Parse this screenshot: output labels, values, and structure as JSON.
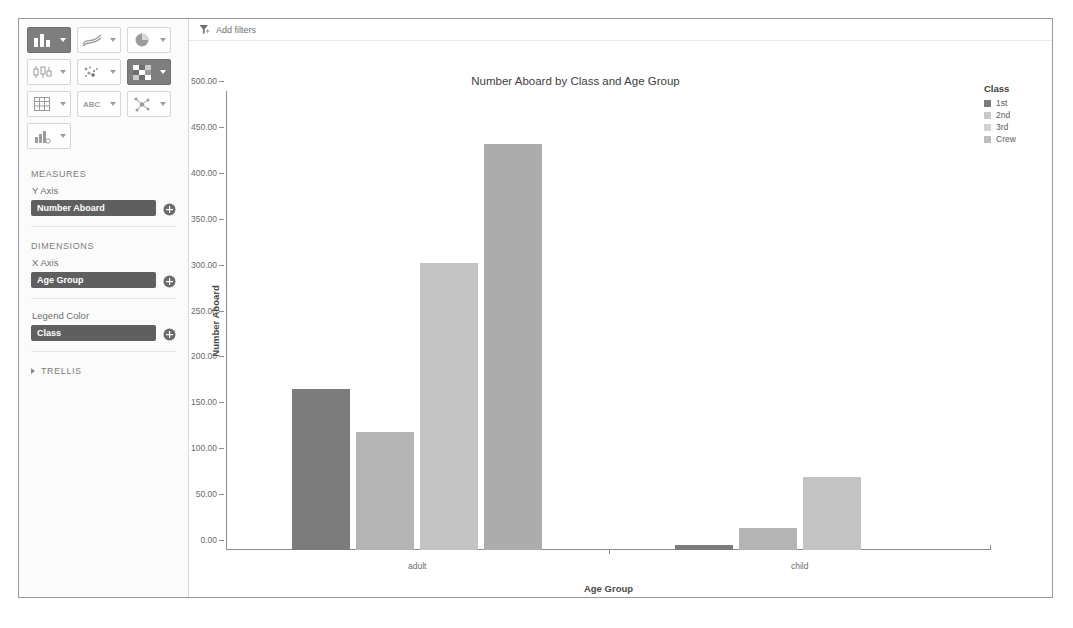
{
  "toolbar": {
    "filter_icon": "filter-icon",
    "add_filters_label": "Add filters"
  },
  "sidebar": {
    "chart_types": [
      {
        "id": "bar",
        "icon": "bar-chart-icon",
        "selected": true
      },
      {
        "id": "line",
        "icon": "line-chart-icon",
        "selected": false
      },
      {
        "id": "pie",
        "icon": "pie-chart-icon",
        "selected": false
      },
      {
        "id": "boxplot",
        "icon": "box-plot-icon",
        "selected": false
      },
      {
        "id": "scatter",
        "icon": "scatter-plot-icon",
        "selected": false
      },
      {
        "id": "heatmap",
        "icon": "heat-map-icon",
        "selected": true
      },
      {
        "id": "table",
        "icon": "table-grid-icon",
        "selected": false
      },
      {
        "id": "text",
        "icon": "abc-text-icon",
        "selected": false
      },
      {
        "id": "network",
        "icon": "network-graph-icon",
        "selected": false
      },
      {
        "id": "combo",
        "icon": "combo-chart-icon",
        "selected": false
      }
    ],
    "measures": {
      "section_label": "MEASURES",
      "fields": [
        {
          "label": "Y Axis",
          "value": "Number Aboard",
          "add_icon": "add-circle-icon"
        }
      ]
    },
    "dimensions": {
      "section_label": "DIMENSIONS",
      "fields": [
        {
          "label": "X Axis",
          "value": "Age Group",
          "add_icon": "add-circle-icon"
        },
        {
          "label": "Legend Color",
          "value": "Class",
          "add_icon": "add-circle-icon"
        }
      ]
    },
    "trellis": {
      "section_label": "TRELLIS",
      "expand_icon": "chevron-right-icon",
      "expanded": false
    }
  },
  "chart_data": {
    "type": "bar",
    "title": "Number Aboard by Class and Age Group",
    "xlabel": "Age Group",
    "ylabel": "Number Aboard",
    "categories": [
      "adult",
      "child"
    ],
    "series": [
      {
        "name": "1st",
        "color": "#7c7c7c",
        "values": [
          175,
          6
        ]
      },
      {
        "name": "2nd",
        "color": "#b4b4b4",
        "values": [
          129,
          24
        ]
      },
      {
        "name": "3rd",
        "color": "#c3c3c3",
        "values": [
          313,
          79
        ]
      },
      {
        "name": "Crew",
        "color": "#acacac",
        "values": [
          442,
          0
        ]
      }
    ],
    "ylim": [
      0,
      500
    ],
    "yticks": [
      0,
      50,
      100,
      150,
      200,
      250,
      300,
      350,
      400,
      450,
      500
    ],
    "ytick_labels": [
      "0.00",
      "50.00",
      "100.00",
      "150.00",
      "200.00",
      "250.00",
      "300.00",
      "350.00",
      "400.00",
      "450.00",
      "500.00"
    ],
    "grid": false,
    "legend": {
      "title": "Class",
      "position": "right",
      "entries": [
        {
          "label": "1st",
          "color": "#7c7c7c"
        },
        {
          "label": "2nd",
          "color": "#c9c9c9"
        },
        {
          "label": "3rd",
          "color": "#d2d2d2"
        },
        {
          "label": "Crew",
          "color": "#bdbdbd"
        }
      ]
    }
  }
}
